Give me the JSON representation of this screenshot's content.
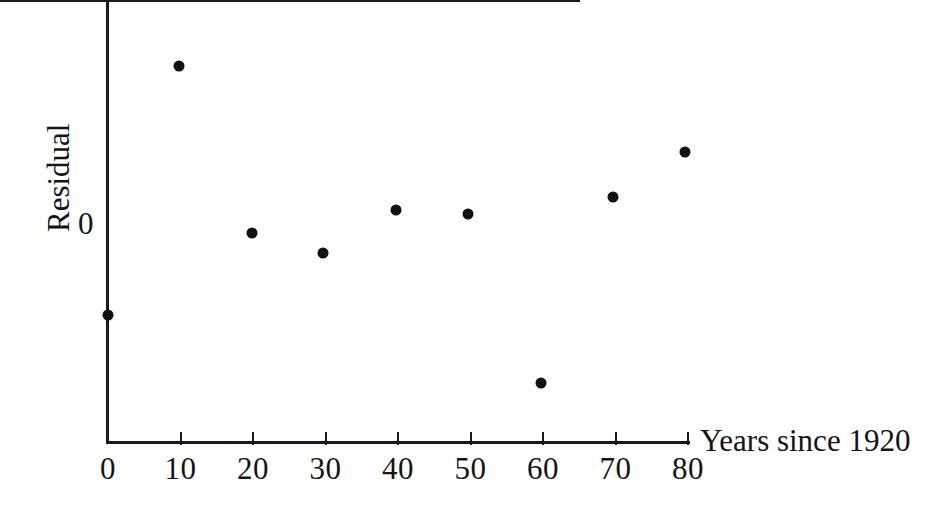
{
  "figure": {
    "title": "",
    "background_color": "#ffffff",
    "ink_color": "#111111"
  },
  "axes": {
    "x_label": "Years since 1920",
    "y_label": "Residual",
    "y_zero_label": "0"
  },
  "chart_data": {
    "type": "scatter",
    "title": "",
    "xlabel": "Years since 1920",
    "ylabel": "Residual",
    "xlim": [
      0,
      80
    ],
    "ylim": [
      -2.2,
      2.2
    ],
    "xticks": [
      0,
      10,
      20,
      30,
      40,
      50,
      60,
      70,
      80
    ],
    "xticklabels": [
      "0",
      "10",
      "20",
      "30",
      "40",
      "50",
      "60",
      "70",
      "80"
    ],
    "yticks": [
      0
    ],
    "yticklabels": [
      "0"
    ],
    "grid": false,
    "legend": null,
    "reference_lines": [
      {
        "name": "zero-residual-line",
        "orientation": "horizontal",
        "y": 0
      }
    ],
    "x": [
      0,
      9,
      19,
      29,
      39,
      49,
      59,
      69,
      79
    ],
    "y": [
      -1.26,
      2.19,
      -0.12,
      -0.4,
      0.19,
      0.14,
      -2.2,
      0.37,
      1.0
    ],
    "points": [
      {
        "x": 0,
        "y": -1.26,
        "px": 108,
        "py": 315
      },
      {
        "x": 9,
        "y": 2.19,
        "px": 179,
        "py": 66
      },
      {
        "x": 19,
        "y": -0.12,
        "px": 252,
        "py": 233
      },
      {
        "x": 29,
        "y": -0.4,
        "px": 323,
        "py": 253
      },
      {
        "x": 39,
        "y": 0.19,
        "px": 396,
        "py": 210
      },
      {
        "x": 49,
        "y": 0.14,
        "px": 468,
        "py": 214
      },
      {
        "x": 59,
        "y": -2.2,
        "px": 541,
        "py": 383
      },
      {
        "x": 69,
        "y": 0.37,
        "px": 613,
        "py": 197
      },
      {
        "x": 79,
        "y": 1.0,
        "px": 685,
        "py": 152
      }
    ]
  }
}
